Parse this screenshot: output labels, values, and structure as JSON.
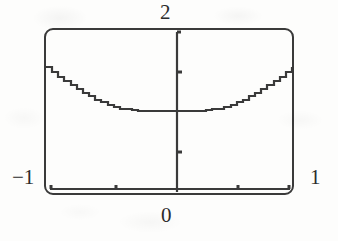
{
  "figure": {
    "kind": "function-plot",
    "background_color": "#fdfdfc",
    "ink_color": "#3a3a3a",
    "frame": {
      "x": 44,
      "y": 28,
      "width": 250,
      "height": 167,
      "corner_radius": 9,
      "stroke_width": 2
    },
    "labels": {
      "top": "2",
      "bottom": "0",
      "left": "−1",
      "right": "1"
    }
  },
  "chart_data": {
    "type": "line",
    "title": "",
    "xlabel": "",
    "ylabel": "",
    "xlim": [
      -1,
      1
    ],
    "ylim": [
      0,
      2
    ],
    "grid": false,
    "legend": null,
    "x_axis": {
      "label_left": "−1",
      "label_right": "1",
      "label_origin": "0",
      "tick_values": [
        -0.5,
        0,
        0.5
      ],
      "axis_position_y": 0
    },
    "y_axis": {
      "label_top": "2",
      "tick_values": [
        0.5,
        1.5
      ],
      "axis_position_x": 0
    },
    "series": [
      {
        "name": "curve",
        "style": "staircase-aliased",
        "x": [
          -1.0,
          -0.95,
          -0.9,
          -0.85,
          -0.8,
          -0.75,
          -0.7,
          -0.65,
          -0.6,
          -0.55,
          -0.5,
          -0.45,
          -0.4,
          -0.35,
          -0.3,
          -0.25,
          -0.2,
          -0.15,
          -0.1,
          -0.05,
          0.0,
          0.05,
          0.1,
          0.15,
          0.2,
          0.25,
          0.3,
          0.35,
          0.4,
          0.45,
          0.5,
          0.55,
          0.6,
          0.65,
          0.7,
          0.75,
          0.8,
          0.85,
          0.9,
          0.95,
          1.0
        ],
        "y": [
          1.54,
          1.48,
          1.42,
          1.37,
          1.32,
          1.27,
          1.22,
          1.18,
          1.14,
          1.11,
          1.08,
          1.05,
          1.03,
          1.02,
          1.01,
          1.0,
          1.0,
          1.0,
          1.0,
          1.0,
          1.0,
          1.0,
          1.0,
          1.0,
          1.0,
          1.0,
          1.01,
          1.02,
          1.03,
          1.05,
          1.08,
          1.11,
          1.14,
          1.18,
          1.22,
          1.27,
          1.32,
          1.37,
          1.42,
          1.48,
          1.54
        ]
      }
    ]
  },
  "plot_geometry": {
    "note": "pixel mapping used by template",
    "px_left": 46,
    "px_right": 292,
    "px_top": 30,
    "px_bottom": 192,
    "axis_x_px": 177,
    "axis_baseline_y_px": 189,
    "curve_min_y_px": 115,
    "curve_end_y_px": 43
  }
}
